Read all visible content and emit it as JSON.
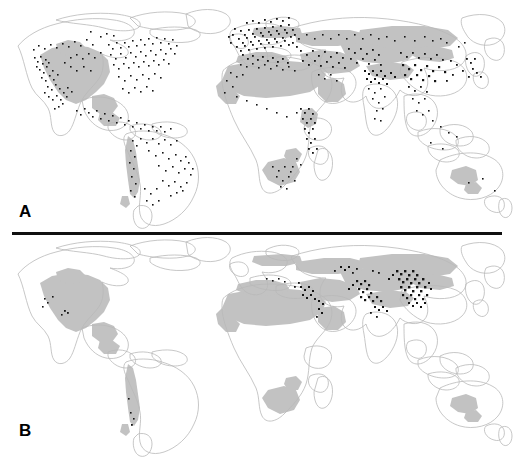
{
  "figure": {
    "type": "two-panel-world-distribution-map",
    "width": 514,
    "height": 460,
    "background_color": "#ffffff",
    "divider": {
      "present": true,
      "color": "#101010",
      "x_start": 12,
      "x_end": 502,
      "y": 232,
      "thickness": 3
    }
  },
  "colors": {
    "coastline": "#b9b9b9",
    "range_fill": "#c2c2c2",
    "occurrence_dot": "#141414",
    "label_text": "#000000",
    "background": "#ffffff"
  },
  "panels": [
    {
      "id": "A",
      "label": "A",
      "label_position": {
        "x": 19,
        "y": 203
      },
      "description": "World map with extensive gray shaded range and dense global black occurrence dots",
      "dot_count_visual": "dense",
      "regions_with_dots": [
        "western North America",
        "eastern North America",
        "Mexico and Central America",
        "Caribbean",
        "Andes",
        "southeastern Brazil",
        "northern Argentina",
        "western Europe",
        "central Europe",
        "Mediterranean basin",
        "North Africa",
        "East African highlands",
        "southern Africa",
        "Caucasus",
        "Middle East",
        "Central Asia",
        "northern India",
        "Himalaya",
        "southern China",
        "eastern China",
        "Japan",
        "Southeast Asia"
      ],
      "gray_range_regions": [
        "western and central North America",
        "Mexican highlands",
        "Andean strip",
        "Sahara and Sahel",
        "Arabian Peninsula",
        "southern Africa interior",
        "East African highlands",
        "southern Europe",
        "Anatolia and Iran",
        "Central Asia",
        "Tibetan Plateau",
        "Mongolia and Siberia steppe",
        "inland Australia"
      ]
    },
    {
      "id": "B",
      "label": "B",
      "label_position": {
        "x": 19,
        "y": 422
      },
      "description": "World map with the same gray shaded range but sparse black occurrence dots restricted mainly to highland Asia",
      "dot_count_visual": "sparse",
      "regions_with_dots": [
        "Caucasus",
        "eastern Turkey",
        "Iranian plateau",
        "Tian Shan",
        "Pamir",
        "Himalaya",
        "Tibetan Plateau margin",
        "northern China",
        "western North America (few)",
        "southern Andes (few)"
      ],
      "gray_range_regions": [
        "western and central North America",
        "Mexican highlands",
        "Andean strip",
        "Sahara and Sahel",
        "Arabian Peninsula",
        "southern Africa interior",
        "southern Europe",
        "Anatolia and Iran",
        "Central Asia",
        "Tibetan Plateau",
        "Mongolia and Siberia steppe",
        "inland Australia"
      ]
    }
  ],
  "legend": {
    "present": false,
    "items": []
  },
  "axes": {
    "present": false
  }
}
